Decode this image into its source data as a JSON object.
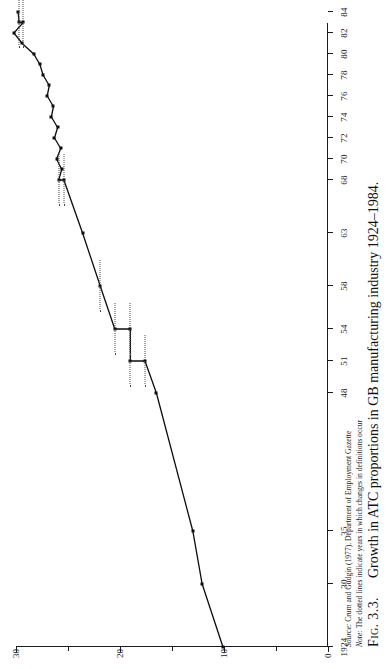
{
  "figure": {
    "caption_label": "Fig. 3.3.",
    "caption_text": "Growth in ATC proportions in GB manufacturing industry 1924–1984.",
    "source_prefix": "Source:",
    "source_text": "Crum and Gudgin (1977). Department of Employment Gazette",
    "note_prefix": "Note:",
    "note_text": "The dotted lines indicate years in which changes in definitions occur"
  },
  "chart_data": {
    "type": "line",
    "title": "Growth in ATC proportions in GB manufacturing industry 1924–1984",
    "xlabel": "",
    "ylabel": "",
    "orientation": "rotated-90-on-page",
    "grid": false,
    "legend": "none",
    "xlim": [
      1924,
      1984
    ],
    "ylim": [
      0,
      30
    ],
    "yticks": [
      0,
      10,
      20,
      30
    ],
    "ytick_labels": [
      "0",
      "10",
      "20",
      "30"
    ],
    "ytick_minor": [
      5,
      15,
      25
    ],
    "xticks": [
      1924,
      1930,
      1935,
      1948,
      1951,
      1954,
      1958,
      1963,
      1968,
      1970,
      1972,
      1974,
      1976,
      1978,
      1980,
      1982,
      1984
    ],
    "xtick_labels": [
      "1924",
      "30",
      "35",
      "48",
      "51",
      "54",
      "58",
      "63",
      "68",
      "70",
      "72",
      "74",
      "76",
      "78",
      "80",
      "82",
      "84"
    ],
    "definition_change_years": [
      1951,
      1954,
      1958,
      1968,
      1983
    ],
    "x": [
      1924,
      1930,
      1935,
      1948,
      1951,
      1951,
      1954,
      1954,
      1958,
      1963,
      1968,
      1968,
      1969,
      1970,
      1971,
      1972,
      1973,
      1974,
      1975,
      1976,
      1977,
      1978,
      1979,
      1980,
      1981,
      1982,
      1983,
      1983,
      1984
    ],
    "y": [
      10.1,
      12.1,
      13.0,
      16.5,
      17.6,
      19.0,
      19.0,
      20.5,
      21.9,
      23.6,
      25.4,
      25.9,
      25.6,
      26.1,
      25.7,
      26.3,
      26.0,
      26.6,
      26.4,
      27.0,
      26.8,
      27.4,
      27.7,
      28.3,
      29.4,
      30.2,
      29.3,
      29.7,
      29.8
    ],
    "series": [
      {
        "name": "ATC proportion (%)",
        "points": [
          {
            "x": 1924,
            "y": 10.1,
            "marker": true
          },
          {
            "x": 1930,
            "y": 12.1,
            "marker": true
          },
          {
            "x": 1935,
            "y": 13.0,
            "marker": true
          },
          {
            "x": 1948,
            "y": 16.5,
            "marker": true
          },
          {
            "x": 1951,
            "y": 17.6,
            "marker": true
          },
          {
            "x": 1951,
            "y": 19.0,
            "marker": true
          },
          {
            "x": 1954,
            "y": 19.0,
            "marker": true
          },
          {
            "x": 1954,
            "y": 20.5,
            "marker": true
          },
          {
            "x": 1958,
            "y": 21.9,
            "marker": true
          },
          {
            "x": 1963,
            "y": 23.6,
            "marker": true
          },
          {
            "x": 1968,
            "y": 25.4,
            "marker": true
          },
          {
            "x": 1968,
            "y": 25.9,
            "marker": true
          },
          {
            "x": 1969,
            "y": 25.6,
            "marker": true
          },
          {
            "x": 1970,
            "y": 26.1,
            "marker": true
          },
          {
            "x": 1971,
            "y": 25.7,
            "marker": true
          },
          {
            "x": 1972,
            "y": 26.3,
            "marker": true
          },
          {
            "x": 1973,
            "y": 26.0,
            "marker": true
          },
          {
            "x": 1974,
            "y": 26.6,
            "marker": true
          },
          {
            "x": 1975,
            "y": 26.4,
            "marker": true
          },
          {
            "x": 1976,
            "y": 27.0,
            "marker": true
          },
          {
            "x": 1977,
            "y": 26.8,
            "marker": true
          },
          {
            "x": 1978,
            "y": 27.4,
            "marker": true
          },
          {
            "x": 1979,
            "y": 27.7,
            "marker": true
          },
          {
            "x": 1980,
            "y": 28.3,
            "marker": true
          },
          {
            "x": 1981,
            "y": 29.4,
            "marker": true
          },
          {
            "x": 1982,
            "y": 30.2,
            "marker": true
          },
          {
            "x": 1983,
            "y": 29.3,
            "marker": true
          },
          {
            "x": 1983,
            "y": 29.7,
            "marker": true
          },
          {
            "x": 1984,
            "y": 29.8,
            "marker": true
          }
        ]
      }
    ]
  },
  "colors": {
    "line": "#0d0d0d",
    "axis": "#1c1c1c",
    "dotted": "#4a4a4a",
    "text": "#1a1a1a",
    "background": "#ffffff"
  }
}
